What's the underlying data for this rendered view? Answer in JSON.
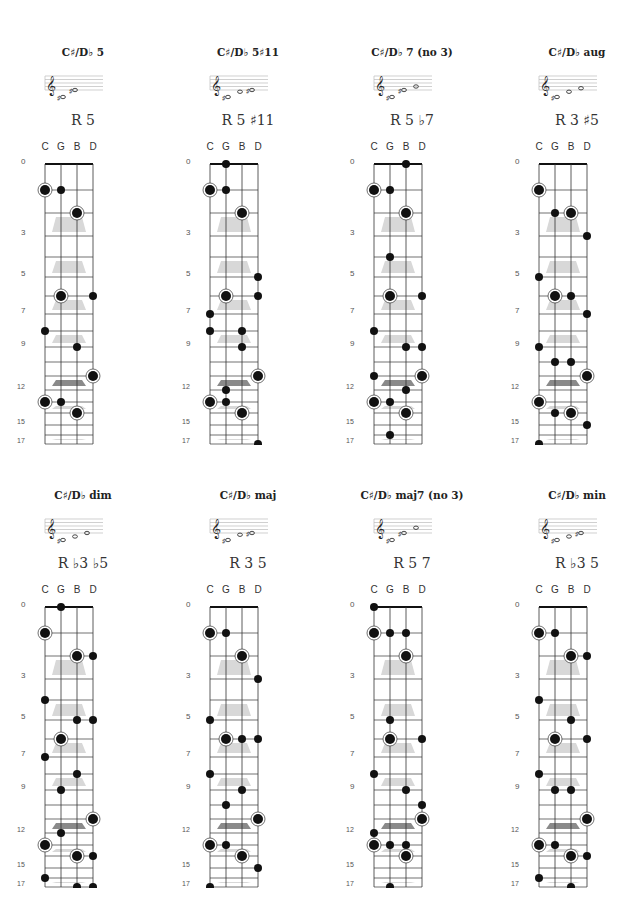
{
  "strings": [
    "C",
    "G",
    "B",
    "D"
  ],
  "fret_labels": [
    {
      "fret": 0,
      "label": "0"
    },
    {
      "fret": 3,
      "label": "3"
    },
    {
      "fret": 5,
      "label": "5"
    },
    {
      "fret": 7,
      "label": "7"
    },
    {
      "fret": 9,
      "label": "9"
    },
    {
      "fret": 12,
      "label": "12"
    },
    {
      "fret": 15,
      "label": "15"
    },
    {
      "fret": 17,
      "label": "17"
    }
  ],
  "fret_offsets": [
    0,
    26,
    49,
    72,
    93,
    113,
    132,
    150,
    167,
    183,
    198,
    212,
    226,
    238,
    249,
    261,
    271,
    280
  ],
  "inlays": [
    {
      "between": [
        2,
        3
      ],
      "dark": false
    },
    {
      "between": [
        4,
        5
      ],
      "dark": false
    },
    {
      "between": [
        6,
        7
      ],
      "dark": false
    },
    {
      "between": [
        8,
        9
      ],
      "dark": false
    },
    {
      "between": [
        11,
        12
      ],
      "dark": true
    },
    {
      "between": [
        13,
        14
      ],
      "dark": false
    },
    {
      "between": [
        16,
        17
      ],
      "dark": false
    }
  ],
  "colors": {
    "dot": "#111111",
    "line": "#333333",
    "inlay": "#d8d8d8",
    "inlay_dark": "#8a8a8a",
    "text": "#222222"
  },
  "chords": [
    {
      "title": "C♯/D♭ 5",
      "formula": "R 5",
      "staff_notes": [
        {
          "pos": -2,
          "acc": "♯"
        },
        {
          "pos": 2,
          "acc": "♯"
        }
      ],
      "dots": {
        "C": [
          [
            1,
            true
          ],
          [
            8,
            false
          ],
          [
            13,
            true
          ]
        ],
        "G": [
          [
            1,
            false
          ],
          [
            6,
            true
          ],
          [
            13,
            false
          ]
        ],
        "B": [
          [
            2,
            true
          ],
          [
            9,
            false
          ],
          [
            14,
            true
          ]
        ],
        "D": [
          [
            6,
            false
          ],
          [
            11,
            true
          ]
        ]
      }
    },
    {
      "title": "C♯/D♭ 5♯11",
      "formula": "R 5 ♯11",
      "staff_notes": [
        {
          "pos": -2,
          "acc": "♯"
        },
        {
          "pos": 1,
          "acc": ""
        },
        {
          "pos": 2,
          "acc": "♯"
        }
      ],
      "dots": {
        "C": [
          [
            1,
            true
          ],
          [
            7,
            false
          ],
          [
            8,
            false
          ],
          [
            13,
            true
          ]
        ],
        "G": [
          [
            0,
            false
          ],
          [
            1,
            false
          ],
          [
            6,
            true
          ],
          [
            12,
            false
          ],
          [
            13,
            false
          ]
        ],
        "B": [
          [
            2,
            true
          ],
          [
            8,
            false
          ],
          [
            9,
            false
          ],
          [
            14,
            true
          ]
        ],
        "D": [
          [
            5,
            false
          ],
          [
            6,
            false
          ],
          [
            11,
            true
          ],
          [
            17,
            false
          ]
        ]
      }
    },
    {
      "title": "C♯/D♭ 7 (no 3)",
      "formula": "R 5 ♭7",
      "staff_notes": [
        {
          "pos": -2,
          "acc": "♯"
        },
        {
          "pos": 2,
          "acc": "♯"
        },
        {
          "pos": 4,
          "acc": ""
        }
      ],
      "dots": {
        "C": [
          [
            1,
            true
          ],
          [
            8,
            false
          ],
          [
            11,
            false
          ],
          [
            13,
            true
          ]
        ],
        "G": [
          [
            1,
            false
          ],
          [
            4,
            false
          ],
          [
            6,
            true
          ],
          [
            13,
            false
          ],
          [
            16,
            false
          ]
        ],
        "B": [
          [
            0,
            false
          ],
          [
            2,
            true
          ],
          [
            9,
            false
          ],
          [
            12,
            false
          ],
          [
            14,
            true
          ]
        ],
        "D": [
          [
            6,
            false
          ],
          [
            9,
            false
          ],
          [
            11,
            true
          ]
        ]
      }
    },
    {
      "title": "C♯/D♭ aug",
      "formula": "R 3 ♯5",
      "staff_notes": [
        {
          "pos": -2,
          "acc": "♯"
        },
        {
          "pos": 1,
          "acc": ""
        },
        {
          "pos": 3,
          "acc": ""
        }
      ],
      "dots": {
        "C": [
          [
            1,
            true
          ],
          [
            5,
            false
          ],
          [
            9,
            false
          ],
          [
            13,
            true
          ],
          [
            17,
            false
          ]
        ],
        "G": [
          [
            2,
            false
          ],
          [
            6,
            true
          ],
          [
            10,
            false
          ],
          [
            14,
            false
          ]
        ],
        "B": [
          [
            2,
            true
          ],
          [
            6,
            false
          ],
          [
            10,
            false
          ],
          [
            14,
            true
          ]
        ],
        "D": [
          [
            3,
            false
          ],
          [
            7,
            false
          ],
          [
            11,
            true
          ],
          [
            15,
            false
          ]
        ]
      }
    },
    {
      "title": "C♯/D♭ dim",
      "formula": "R ♭3 ♭5",
      "staff_notes": [
        {
          "pos": -2,
          "acc": "♯"
        },
        {
          "pos": 0,
          "acc": ""
        },
        {
          "pos": 2,
          "acc": ""
        }
      ],
      "dots": {
        "C": [
          [
            1,
            true
          ],
          [
            4,
            false
          ],
          [
            7,
            false
          ],
          [
            13,
            true
          ],
          [
            16,
            false
          ]
        ],
        "G": [
          [
            0,
            false
          ],
          [
            6,
            true
          ],
          [
            9,
            false
          ],
          [
            12,
            false
          ]
        ],
        "B": [
          [
            2,
            true
          ],
          [
            5,
            false
          ],
          [
            8,
            false
          ],
          [
            14,
            true
          ],
          [
            17,
            false
          ]
        ],
        "D": [
          [
            2,
            false
          ],
          [
            5,
            false
          ],
          [
            11,
            true
          ],
          [
            14,
            false
          ],
          [
            17,
            false
          ]
        ]
      }
    },
    {
      "title": "C♯/D♭ maj",
      "formula": "R 3 5",
      "staff_notes": [
        {
          "pos": -2,
          "acc": "♯"
        },
        {
          "pos": 1,
          "acc": ""
        },
        {
          "pos": 2,
          "acc": "♯"
        }
      ],
      "dots": {
        "C": [
          [
            1,
            true
          ],
          [
            5,
            false
          ],
          [
            8,
            false
          ],
          [
            13,
            true
          ],
          [
            17,
            false
          ]
        ],
        "G": [
          [
            1,
            false
          ],
          [
            6,
            true
          ],
          [
            10,
            false
          ],
          [
            13,
            false
          ]
        ],
        "B": [
          [
            2,
            true
          ],
          [
            6,
            false
          ],
          [
            9,
            false
          ],
          [
            14,
            true
          ]
        ],
        "D": [
          [
            3,
            false
          ],
          [
            6,
            false
          ],
          [
            11,
            true
          ],
          [
            15,
            false
          ]
        ]
      }
    },
    {
      "title": "C♯/D♭ maj7 (no 3)",
      "formula": "R 5 7",
      "staff_notes": [
        {
          "pos": -2,
          "acc": "♯"
        },
        {
          "pos": 2,
          "acc": "♯"
        },
        {
          "pos": 5,
          "acc": ""
        }
      ],
      "dots": {
        "C": [
          [
            0,
            false
          ],
          [
            1,
            true
          ],
          [
            8,
            false
          ],
          [
            12,
            false
          ],
          [
            13,
            true
          ]
        ],
        "G": [
          [
            1,
            false
          ],
          [
            5,
            false
          ],
          [
            6,
            true
          ],
          [
            13,
            false
          ],
          [
            17,
            false
          ]
        ],
        "B": [
          [
            1,
            false
          ],
          [
            2,
            true
          ],
          [
            9,
            false
          ],
          [
            13,
            false
          ],
          [
            14,
            true
          ]
        ],
        "D": [
          [
            6,
            false
          ],
          [
            10,
            false
          ],
          [
            11,
            true
          ]
        ]
      }
    },
    {
      "title": "C♯/D♭ min",
      "formula": "R ♭3 5",
      "staff_notes": [
        {
          "pos": -2,
          "acc": "♯"
        },
        {
          "pos": 0,
          "acc": ""
        },
        {
          "pos": 2,
          "acc": "♯"
        }
      ],
      "dots": {
        "C": [
          [
            1,
            true
          ],
          [
            4,
            false
          ],
          [
            8,
            false
          ],
          [
            13,
            true
          ],
          [
            16,
            false
          ]
        ],
        "G": [
          [
            1,
            false
          ],
          [
            6,
            true
          ],
          [
            9,
            false
          ],
          [
            13,
            false
          ]
        ],
        "B": [
          [
            2,
            true
          ],
          [
            5,
            false
          ],
          [
            9,
            false
          ],
          [
            14,
            true
          ],
          [
            17,
            false
          ]
        ],
        "D": [
          [
            2,
            false
          ],
          [
            6,
            false
          ],
          [
            11,
            true
          ],
          [
            14,
            false
          ]
        ]
      }
    }
  ]
}
